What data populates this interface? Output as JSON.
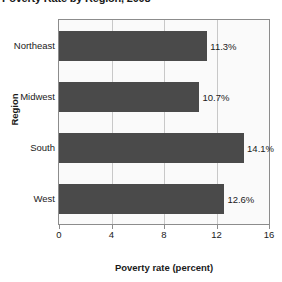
{
  "chart_data": {
    "type": "bar",
    "orientation": "horizontal",
    "title": "Poverty Rate by Region, 2008",
    "xlabel": "Poverty rate (percent)",
    "ylabel": "Region",
    "categories": [
      "Northeast",
      "Midwest",
      "South",
      "West"
    ],
    "values": [
      11.3,
      10.7,
      14.1,
      12.6
    ],
    "data_labels": [
      "11.3%",
      "10.7%",
      "14.1%",
      "12.6%"
    ],
    "xlim": [
      0,
      16
    ],
    "xticks": [
      0,
      4,
      8,
      12,
      16
    ],
    "xtick_labels": [
      "0",
      "4",
      "8",
      "12",
      "16"
    ],
    "grid": true,
    "legend": false,
    "colors": {
      "bar": "#4a4a4a",
      "plot_background": "#fafafa",
      "gridline": "#c8c8c8",
      "axis": "#8c8c8c",
      "text": "#1a1a1a",
      "page_background": "#ffffff"
    }
  }
}
